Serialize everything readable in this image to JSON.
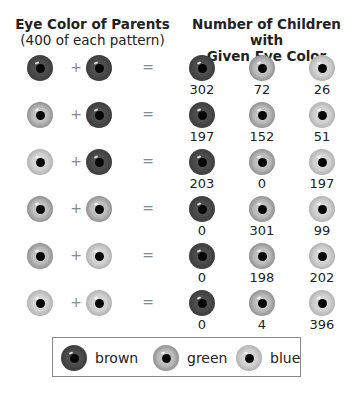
{
  "header": {
    "left_title": "Eye Color of Parents",
    "left_subtitle": "(400 of each pattern)",
    "right_title_line1": "Number of Children with",
    "right_title_line2": "Given Eye Color"
  },
  "operators": {
    "plus": "+",
    "equals": "="
  },
  "rows": [
    {
      "parent1": "brown",
      "parent2": "brown",
      "children": {
        "brown": "302",
        "green": "72",
        "blue": "26"
      }
    },
    {
      "parent1": "green",
      "parent2": "brown",
      "children": {
        "brown": "197",
        "green": "152",
        "blue": "51"
      }
    },
    {
      "parent1": "blue",
      "parent2": "brown",
      "children": {
        "brown": "203",
        "green": "0",
        "blue": "197"
      }
    },
    {
      "parent1": "green",
      "parent2": "green",
      "children": {
        "brown": "0",
        "green": "301",
        "blue": "99"
      }
    },
    {
      "parent1": "green",
      "parent2": "blue",
      "children": {
        "brown": "0",
        "green": "198",
        "blue": "202"
      }
    },
    {
      "parent1": "blue",
      "parent2": "blue",
      "children": {
        "brown": "0",
        "green": "4",
        "blue": "396"
      }
    }
  ],
  "legend": [
    {
      "color": "brown",
      "label": "brown"
    },
    {
      "color": "green",
      "label": "green"
    },
    {
      "color": "blue",
      "label": "blue"
    }
  ]
}
